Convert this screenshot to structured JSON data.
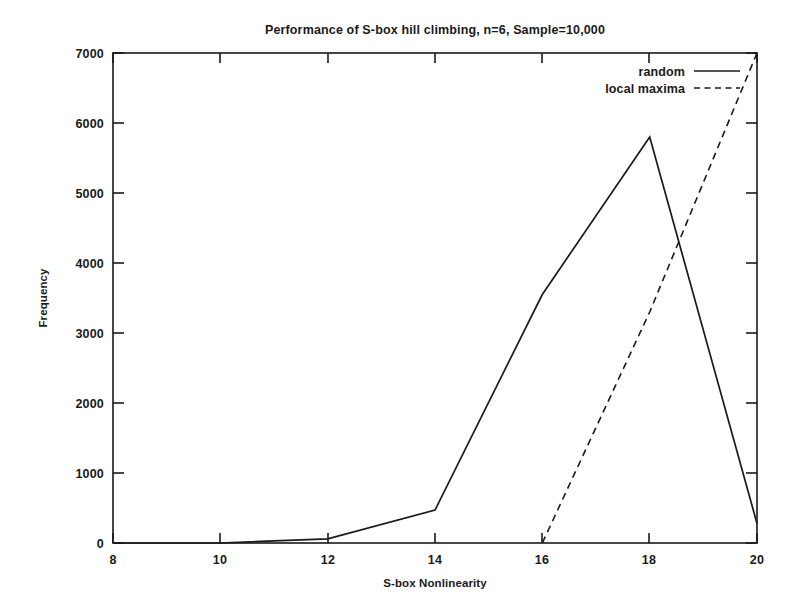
{
  "chart_data": {
    "type": "line",
    "title": "Performance of S-box hill climbing, n=6, Sample=10,000",
    "xlabel": "S-box Nonlinearity",
    "ylabel": "Frequency",
    "xlim": [
      8,
      20
    ],
    "ylim": [
      0,
      7000
    ],
    "xticks": [
      8,
      10,
      12,
      14,
      16,
      18,
      20
    ],
    "yticks": [
      0,
      1000,
      2000,
      3000,
      4000,
      5000,
      6000,
      7000
    ],
    "xtick_labels": [
      "8",
      "10",
      "12",
      "14",
      "16",
      "18",
      "20"
    ],
    "ytick_labels": [
      "0",
      "1000",
      "2000",
      "3000",
      "4000",
      "5000",
      "6000",
      "7000"
    ],
    "grid": false,
    "legend_position": "top-right",
    "series": [
      {
        "name": "random",
        "style": "solid",
        "x": [
          8,
          10,
          12,
          14,
          16,
          18,
          20
        ],
        "values": [
          0,
          0,
          60,
          470,
          3550,
          5800,
          280
        ]
      },
      {
        "name": "local maxima",
        "style": "dashed",
        "x": [
          16,
          18,
          20
        ],
        "values": [
          0,
          3300,
          7000
        ]
      }
    ]
  },
  "legend": {
    "entries": [
      {
        "label": "random",
        "style": "solid"
      },
      {
        "label": "local maxima",
        "style": "dashed"
      }
    ]
  }
}
